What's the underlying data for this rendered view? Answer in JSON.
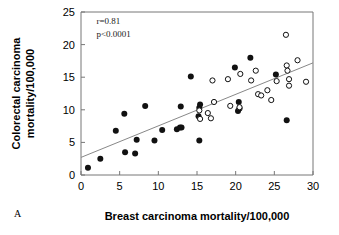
{
  "chart_data": {
    "type": "scatter",
    "title": "",
    "panel_label": "A",
    "xlabel": "Breast carcinoma mortality/100,000",
    "ylabel": "Colorectal carcinoma mortality/100,000",
    "ylabel_line1": "Colorectal carcinoma",
    "ylabel_line2": "mortality/100,000",
    "xlim": [
      0,
      30
    ],
    "ylim": [
      0,
      25
    ],
    "xticks": [
      0,
      5,
      10,
      15,
      20,
      25,
      30
    ],
    "yticks": [
      0,
      5,
      10,
      15,
      20,
      25
    ],
    "xtick_labels": [
      "0",
      "5",
      "10",
      "15",
      "20",
      "25",
      "30"
    ],
    "ytick_labels": [
      "0",
      "5",
      "10",
      "15",
      "20",
      "25"
    ],
    "grid": false,
    "legend": "none",
    "annotations": [
      {
        "name": "correlation",
        "text": "r=0.81",
        "x": 2.0,
        "y": 23.2
      },
      {
        "name": "pvalue",
        "text": "p<0.0001",
        "x": 2.0,
        "y": 21.2
      }
    ],
    "regression_line": {
      "name": "fit-line",
      "x0": 0,
      "y0": 2.7,
      "x1": 30,
      "y1": 17.2
    },
    "series": [
      {
        "name": "filled-markers",
        "marker": "filled-circle",
        "color": "#111111",
        "points": [
          [
            0.9,
            1.1
          ],
          [
            2.5,
            2.5
          ],
          [
            4.5,
            6.8
          ],
          [
            5.6,
            9.4
          ],
          [
            5.7,
            3.5
          ],
          [
            7.0,
            3.3
          ],
          [
            7.2,
            5.4
          ],
          [
            8.3,
            10.6
          ],
          [
            9.5,
            5.3
          ],
          [
            10.5,
            6.9
          ],
          [
            12.4,
            7.0
          ],
          [
            12.8,
            7.3
          ],
          [
            13.0,
            7.3
          ],
          [
            12.9,
            10.5
          ],
          [
            14.2,
            15.1
          ],
          [
            15.2,
            9.0
          ],
          [
            15.3,
            10.3
          ],
          [
            15.4,
            10.8
          ],
          [
            15.3,
            5.3
          ],
          [
            19.9,
            16.5
          ],
          [
            20.3,
            9.8
          ],
          [
            20.5,
            10.2
          ],
          [
            20.4,
            11.2
          ],
          [
            21.9,
            18.0
          ],
          [
            25.2,
            15.4
          ],
          [
            26.6,
            8.4
          ]
        ]
      },
      {
        "name": "open-markers",
        "marker": "open-circle",
        "color": "#111111",
        "points": [
          [
            15.3,
            9.9
          ],
          [
            15.4,
            8.6
          ],
          [
            16.4,
            9.5
          ],
          [
            16.8,
            8.7
          ],
          [
            17.0,
            14.5
          ],
          [
            17.2,
            11.2
          ],
          [
            19.0,
            14.7
          ],
          [
            19.3,
            10.6
          ],
          [
            20.5,
            10.4
          ],
          [
            20.6,
            15.5
          ],
          [
            22.0,
            14.5
          ],
          [
            22.6,
            16.0
          ],
          [
            22.9,
            12.4
          ],
          [
            23.3,
            12.2
          ],
          [
            24.1,
            13.0
          ],
          [
            24.6,
            11.5
          ],
          [
            25.3,
            14.4
          ],
          [
            26.5,
            21.5
          ],
          [
            26.6,
            16.8
          ],
          [
            26.7,
            16.0
          ],
          [
            26.9,
            14.7
          ],
          [
            26.9,
            13.7
          ],
          [
            28.0,
            17.6
          ],
          [
            29.1,
            14.3
          ]
        ]
      }
    ]
  }
}
